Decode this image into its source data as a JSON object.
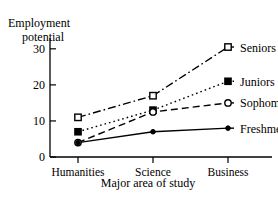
{
  "chart_data": {
    "type": "line",
    "title": "",
    "categories": [
      "Humanities",
      "Science",
      "Business"
    ],
    "series": [
      {
        "name": "Seniors",
        "values": [
          11,
          17,
          30.5
        ],
        "marker": "open-square",
        "line_style": "dash-dot",
        "color": "#000000"
      },
      {
        "name": "Juniors",
        "values": [
          7,
          13,
          21
        ],
        "marker": "filled-square",
        "line_style": "dotted",
        "color": "#000000"
      },
      {
        "name": "Sophomores",
        "values": [
          4,
          12.5,
          15
        ],
        "marker": "open-circle",
        "line_style": "dashed",
        "color": "#000000"
      },
      {
        "name": "Freshmen",
        "values": [
          4,
          7,
          8
        ],
        "marker": "filled-circle",
        "line_style": "solid",
        "color": "#000000"
      }
    ],
    "ylabel_line1": "Employment",
    "ylabel_line2": "potential",
    "xlabel": "Major area of study",
    "ylim": [
      0,
      33
    ],
    "yticks": [
      "0",
      "10",
      "20",
      "30"
    ],
    "ytick_values": [
      0,
      10,
      20,
      30
    ],
    "grid": false,
    "legend_position": "right-inline"
  },
  "axis": {
    "y_title_line1": "Employment",
    "y_title_line2": "potential",
    "x_title": "Major area of study"
  },
  "ticks": {
    "y": [
      "0",
      "10",
      "20",
      "30"
    ],
    "x": [
      "Humanities",
      "Science",
      "Business"
    ]
  },
  "legend": {
    "items": [
      "Seniors",
      "Juniors",
      "Sophomores",
      "Freshmen"
    ]
  }
}
